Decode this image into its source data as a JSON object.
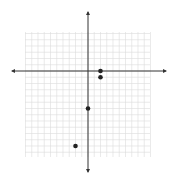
{
  "chart_data": {
    "type": "scatter",
    "title": "",
    "xlabel": "",
    "ylabel": "",
    "grid": true,
    "xlim": [
      -10,
      10
    ],
    "ylim": [
      -14,
      6
    ],
    "points": [
      {
        "x": 2,
        "y": 0
      },
      {
        "x": 2,
        "y": -1
      },
      {
        "x": 0,
        "y": -6
      },
      {
        "x": -2,
        "y": -12
      }
    ]
  },
  "layout": {
    "origin_px": [
      88,
      71
    ],
    "unit_px": 6.25,
    "grid_left": 25,
    "grid_right": 150,
    "grid_top": 32,
    "grid_bottom": 157,
    "axis_x": [
      12,
      166
    ],
    "axis_y": [
      12,
      172
    ],
    "point_px": [
      [
        102,
        71
      ],
      [
        99,
        79
      ],
      [
        88,
        108
      ],
      [
        74,
        146
      ]
    ],
    "colors": {
      "grid": "#dcdcdc",
      "axis": "#333333",
      "point": "#222222"
    }
  }
}
